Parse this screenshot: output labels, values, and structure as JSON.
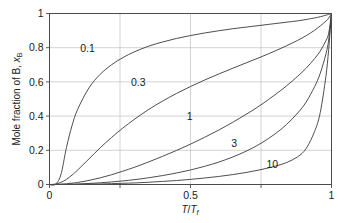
{
  "chart_data": {
    "type": "line",
    "title": "",
    "xlabel": "T/T_f",
    "xlabel_parts": {
      "num": "T",
      "den": "T",
      "den_sub": "f"
    },
    "ylabel": "Mole fraction of B, x_B",
    "ylabel_parts": {
      "text": "Mole fraction of B, ",
      "italic": "x",
      "sub": "B"
    },
    "xlim": [
      0,
      1
    ],
    "ylim": [
      0,
      1
    ],
    "grid": true,
    "grid_x_values": [
      0.25,
      0.5,
      0.75
    ],
    "grid_y_values": [
      0.2,
      0.4,
      0.6,
      0.8
    ],
    "x_tick_values": [
      0,
      0.25,
      0.5,
      0.75,
      1
    ],
    "x_tick_labels": [
      "0",
      "",
      "0.5",
      "",
      "1"
    ],
    "y_tick_values": [
      0,
      0.2,
      0.4,
      0.6,
      0.8,
      1
    ],
    "y_tick_labels": [
      "0",
      "0.2",
      "0.4",
      "0.6",
      "0.8",
      "1"
    ],
    "legend_position": "inline-curve-labels",
    "curve_color": "#3a3a3a",
    "grid_color": "#b6b6b6",
    "frame_color": "#4a4a4a",
    "x": [
      0,
      0.02,
      0.04,
      0.06,
      0.08,
      0.1,
      0.14,
      0.18,
      0.22,
      0.26,
      0.3,
      0.35,
      0.4,
      0.45,
      0.5,
      0.55,
      0.6,
      0.65,
      0.7,
      0.75,
      0.8,
      0.84,
      0.88,
      0.91,
      0.94,
      0.96,
      0.98,
      0.99,
      1
    ],
    "series": [
      {
        "name": "0.1",
        "label": "0.1",
        "label_x": 0.135,
        "label_y": 0.795,
        "values": [
          0,
          0.0,
          0.055,
          0.215,
          0.345,
          0.44,
          0.565,
          0.645,
          0.7,
          0.742,
          0.775,
          0.808,
          0.833,
          0.854,
          0.871,
          0.886,
          0.899,
          0.911,
          0.921,
          0.931,
          0.941,
          0.949,
          0.957,
          0.965,
          0.974,
          0.981,
          0.99,
          0.995,
          1
        ]
      },
      {
        "name": "0.3",
        "label": "0.3",
        "label_x": 0.315,
        "label_y": 0.595,
        "values": [
          0,
          0.002,
          0.012,
          0.03,
          0.055,
          0.085,
          0.15,
          0.215,
          0.275,
          0.33,
          0.38,
          0.437,
          0.487,
          0.532,
          0.573,
          0.611,
          0.646,
          0.68,
          0.713,
          0.746,
          0.781,
          0.811,
          0.843,
          0.87,
          0.902,
          0.927,
          0.955,
          0.973,
          1
        ]
      },
      {
        "name": "1",
        "label": "1",
        "label_x": 0.497,
        "label_y": 0.4,
        "values": [
          0,
          0.0005,
          0.002,
          0.004,
          0.008,
          0.012,
          0.024,
          0.039,
          0.057,
          0.078,
          0.1,
          0.131,
          0.164,
          0.199,
          0.236,
          0.276,
          0.318,
          0.364,
          0.413,
          0.466,
          0.525,
          0.576,
          0.633,
          0.68,
          0.736,
          0.78,
          0.84,
          0.885,
          1
        ]
      },
      {
        "name": "3",
        "label": "3",
        "label_x": 0.655,
        "label_y": 0.238,
        "values": [
          0,
          0.0,
          0.0005,
          0.001,
          0.002,
          0.003,
          0.006,
          0.01,
          0.015,
          0.021,
          0.028,
          0.039,
          0.052,
          0.067,
          0.085,
          0.106,
          0.131,
          0.161,
          0.197,
          0.241,
          0.296,
          0.35,
          0.418,
          0.482,
          0.572,
          0.65,
          0.762,
          0.845,
          1
        ]
      },
      {
        "name": "10",
        "label": "10",
        "label_x": 0.79,
        "label_y": 0.118,
        "values": [
          0,
          0.0,
          0.0,
          0.0,
          0.0005,
          0.001,
          0.002,
          0.003,
          0.005,
          0.007,
          0.009,
          0.013,
          0.018,
          0.023,
          0.03,
          0.038,
          0.047,
          0.058,
          0.071,
          0.087,
          0.107,
          0.128,
          0.162,
          0.21,
          0.31,
          0.42,
          0.63,
          0.79,
          1
        ]
      }
    ]
  }
}
